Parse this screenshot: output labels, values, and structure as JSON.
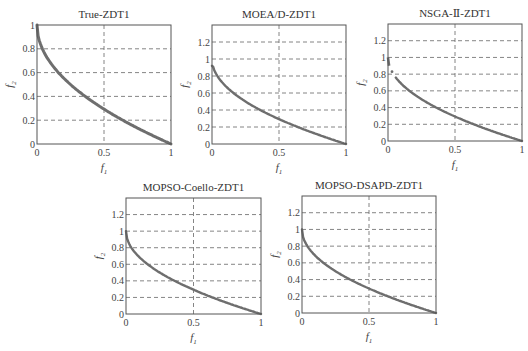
{
  "chart_data": [
    {
      "type": "scatter",
      "title": "True-ZDT1",
      "xlabel": "f1",
      "ylabel": "f2",
      "xlim": [
        0,
        1
      ],
      "ylim": [
        0,
        1
      ],
      "xticks": [
        "0",
        "0.5",
        "1"
      ],
      "yticks": [
        "0",
        "0.2",
        "0.4",
        "0.6",
        "0.8",
        "1"
      ],
      "grid": "dashed",
      "series": [
        {
          "name": "True-ZDT1",
          "curve": "f2 = 1 - sqrt(f1)",
          "x": [
            0,
            0.1,
            0.2,
            0.3,
            0.4,
            0.5,
            0.6,
            0.7,
            0.8,
            0.9,
            1.0
          ],
          "y": [
            1.0,
            0.68,
            0.55,
            0.45,
            0.37,
            0.29,
            0.23,
            0.16,
            0.11,
            0.05,
            0.0
          ]
        }
      ]
    },
    {
      "type": "scatter",
      "title": "MOEA/D-ZDT1",
      "xlabel": "f1",
      "ylabel": "f2",
      "xlim": [
        0,
        1
      ],
      "ylim": [
        0,
        1.4
      ],
      "xticks": [
        "0",
        "0.5",
        "1"
      ],
      "yticks": [
        "0",
        "0.2",
        "0.4",
        "0.6",
        "0.8",
        "1",
        "1.2"
      ],
      "grid": "dashed",
      "series": [
        {
          "name": "MOEA/D",
          "x": [
            0,
            0.1,
            0.2,
            0.3,
            0.4,
            0.5,
            0.6,
            0.7,
            0.8,
            0.9,
            1.0
          ],
          "y": [
            0.92,
            0.68,
            0.55,
            0.45,
            0.37,
            0.29,
            0.23,
            0.16,
            0.11,
            0.05,
            0.0
          ]
        }
      ]
    },
    {
      "type": "scatter",
      "title": "NSGA-Ⅱ-ZDT1",
      "xlabel": "f1",
      "ylabel": "f2",
      "xlim": [
        0,
        1
      ],
      "ylim": [
        0,
        1.4
      ],
      "xticks": [
        "0",
        "0.5",
        "1"
      ],
      "yticks": [
        "0",
        "0.2",
        "0.4",
        "0.6",
        "0.8",
        "1",
        "1.2"
      ],
      "grid": "dashed",
      "series": [
        {
          "name": "NSGA-II",
          "x": [
            0,
            0.01,
            0.03,
            0.06,
            0.1,
            0.2,
            0.3,
            0.4,
            0.5,
            0.6,
            0.7,
            0.8,
            0.9,
            1.0
          ],
          "y": [
            1.0,
            0.9,
            0.83,
            0.76,
            0.68,
            0.55,
            0.45,
            0.37,
            0.29,
            0.23,
            0.16,
            0.11,
            0.05,
            0.0
          ]
        }
      ]
    },
    {
      "type": "scatter",
      "title": "MOPSO-Coello-ZDT1",
      "xlabel": "f1",
      "ylabel": "f2",
      "xlim": [
        0,
        1
      ],
      "ylim": [
        0,
        1.4
      ],
      "xticks": [
        "0",
        "0.5",
        "1"
      ],
      "yticks": [
        "0",
        "0.2",
        "0.4",
        "0.6",
        "0.8",
        "1",
        "1.2"
      ],
      "grid": "dashed",
      "series": [
        {
          "name": "MOPSO-Coello",
          "x": [
            0,
            0.1,
            0.2,
            0.3,
            0.4,
            0.5,
            0.6,
            0.7,
            0.8,
            0.9,
            1.0
          ],
          "y": [
            1.0,
            0.68,
            0.55,
            0.45,
            0.37,
            0.29,
            0.23,
            0.16,
            0.11,
            0.05,
            0.0
          ]
        }
      ]
    },
    {
      "type": "scatter",
      "title": "MOPSO-DSAPD-ZDT1",
      "xlabel": "f1",
      "ylabel": "f2",
      "xlim": [
        0,
        1
      ],
      "ylim": [
        0,
        1.4
      ],
      "xticks": [
        "0",
        "0.5",
        "1"
      ],
      "yticks": [
        "0",
        "0.2",
        "0.4",
        "0.6",
        "0.8",
        "1",
        "1.2"
      ],
      "grid": "dashed",
      "series": [
        {
          "name": "MOPSO-DSAPD",
          "x": [
            0,
            0.1,
            0.2,
            0.3,
            0.4,
            0.5,
            0.6,
            0.7,
            0.8,
            0.9,
            1.0
          ],
          "y": [
            1.0,
            0.68,
            0.55,
            0.45,
            0.37,
            0.29,
            0.23,
            0.16,
            0.11,
            0.05,
            0.0
          ]
        }
      ]
    }
  ],
  "colors": {
    "curve": "#6e6e6e",
    "axis": "#555555",
    "grid": "#666666"
  }
}
